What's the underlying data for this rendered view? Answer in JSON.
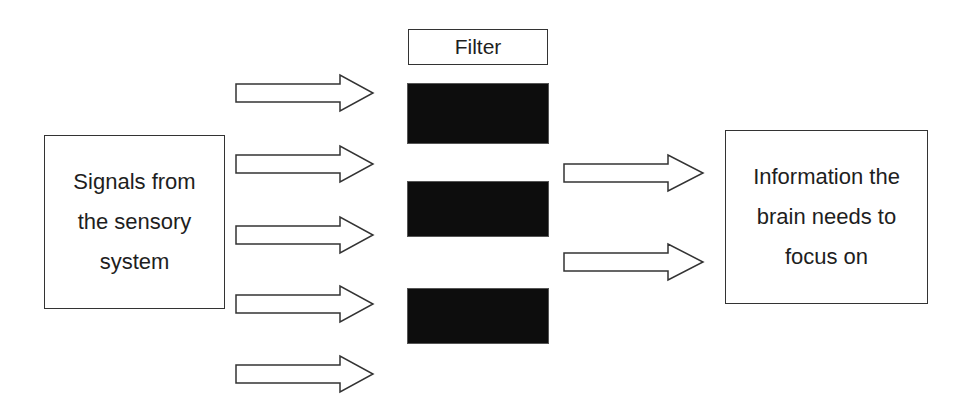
{
  "diagram": {
    "type": "flow",
    "source": {
      "lines": [
        "Signals from",
        "the sensory",
        "system"
      ]
    },
    "filter": {
      "label": "Filter",
      "block_count": 3,
      "block_color": "#0d0d0d"
    },
    "target": {
      "lines": [
        "Information the",
        "brain needs to",
        "focus on"
      ]
    },
    "input_arrow_count": 5,
    "output_arrow_count": 2,
    "stroke_color": "#333333"
  }
}
